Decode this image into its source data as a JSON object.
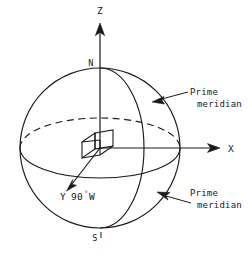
{
  "figure": {
    "stroke_color": "#1a1a1a",
    "background_color": "#ffffff"
  },
  "axes": {
    "z": {
      "label": "Z",
      "direction": "up"
    },
    "x": {
      "label": "X",
      "direction": "right"
    },
    "y": {
      "label": "Y",
      "direction": "down-left",
      "annotation": "90",
      "degree_symbol": "°",
      "hemisphere": "W",
      "full_text": "Y 90°W"
    }
  },
  "poles": {
    "north": {
      "label": "N"
    },
    "south": {
      "label": "S"
    }
  },
  "callouts": [
    {
      "line1": "Prime",
      "line2": "meridian",
      "position": "top-right"
    },
    {
      "line1": "Prime",
      "line2": "meridian",
      "position": "bottom-right"
    }
  ],
  "features": {
    "equator_back": "dashed",
    "equator_front": "solid",
    "origin_marker": "wireframe-cube"
  }
}
